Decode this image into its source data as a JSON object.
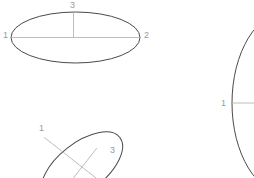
{
  "canvas": {
    "width": 254,
    "height": 178,
    "background": "#ffffff"
  },
  "style": {
    "outline_color": "#4a4a4a",
    "axis_line_color": "#b5b5b5",
    "label_color": "#9a9a9a",
    "outline_width": 1,
    "axis_width": 0.8,
    "label_font_size": 9
  },
  "figures": [
    {
      "id": "ellipse-top-left",
      "name": "horizontal-ellipse",
      "center": {
        "x": 75.5,
        "y": 37.5
      },
      "radius_x": 64.5,
      "radius_y": 25.5,
      "rotation_deg": 0,
      "clipped": false,
      "axes": [
        {
          "name": "major-axis",
          "from": {
            "x": 11,
            "y": 37.5
          },
          "to": {
            "x": 140,
            "y": 37.5
          }
        },
        {
          "name": "minor-axis-upper",
          "from": {
            "x": 73.5,
            "y": 12.5
          },
          "to": {
            "x": 73.5,
            "y": 37.5
          }
        }
      ],
      "labels": [
        {
          "text": "1",
          "x": 3,
          "y": 33,
          "anchor": "left"
        },
        {
          "text": "2",
          "x": 144,
          "y": 33,
          "anchor": "left"
        },
        {
          "text": "3",
          "x": 70,
          "y": 1,
          "anchor": "left"
        }
      ]
    },
    {
      "id": "ellipse-bottom-left",
      "name": "tilted-ellipse",
      "center": {
        "x": 82,
        "y": 167
      },
      "radius_x": 48,
      "radius_y": 24,
      "rotation_deg": -38,
      "clipped": true,
      "axes": [
        {
          "name": "major-axis",
          "from": {
            "x": 44.2,
            "y": 137.4
          },
          "to": {
            "x": 119.8,
            "y": 196.6
          }
        },
        {
          "name": "minor-axis",
          "from": {
            "x": 96.8,
            "y": 148.1
          },
          "to": {
            "x": 67.2,
            "y": 185.9
          }
        }
      ],
      "labels": [
        {
          "text": "1",
          "x": 39,
          "y": 124,
          "anchor": "left"
        },
        {
          "text": "3",
          "x": 110,
          "y": 146,
          "anchor": "left"
        }
      ]
    },
    {
      "id": "ellipse-right",
      "name": "clipped-large-ellipse",
      "center": {
        "x": 288,
        "y": 103
      },
      "radius_x": 56,
      "radius_y": 92,
      "rotation_deg": 0,
      "clipped": true,
      "axes": [
        {
          "name": "major-axis",
          "from": {
            "x": 232,
            "y": 103
          },
          "to": {
            "x": 254,
            "y": 103
          }
        }
      ],
      "labels": [
        {
          "text": "1",
          "x": 221,
          "y": 99,
          "anchor": "left"
        }
      ]
    }
  ]
}
